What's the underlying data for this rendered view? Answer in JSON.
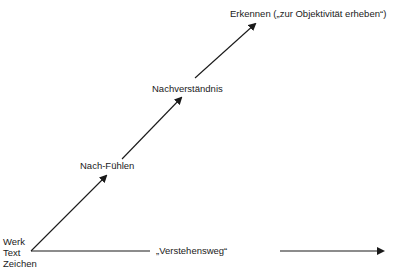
{
  "diagram": {
    "type": "path-diagram",
    "origin": {
      "labels": [
        "Werk",
        "Text",
        "Zeichen"
      ]
    },
    "steps": [
      {
        "label": "Nach-Fühlen"
      },
      {
        "label": "Nachverständnis"
      },
      {
        "label": "Erkennen („zur Objektivität erheben“)"
      }
    ],
    "baseline": {
      "label": "„Verstehensweg“"
    },
    "colors": {
      "line": "#1a1a1a",
      "background": "#ffffff"
    }
  }
}
